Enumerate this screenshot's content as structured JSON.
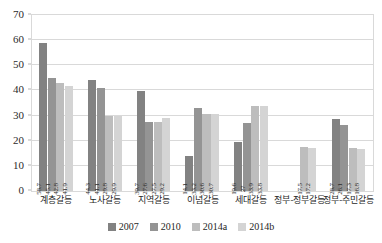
{
  "chart_data": {
    "type": "bar",
    "title": "",
    "xlabel": "",
    "ylabel": "",
    "ylim": [
      0,
      70
    ],
    "ytick_step": 10,
    "yticks": [
      0,
      10,
      20,
      30,
      40,
      50,
      60,
      70
    ],
    "grid": true,
    "legend_position": "bottom",
    "categories": [
      "계층갈등",
      "노사갈등",
      "지역갈등",
      "이념갈등",
      "세대갈등",
      "정부-정부갈등",
      "정부-주민갈등"
    ],
    "series": [
      {
        "name": "2007",
        "color": "#828282",
        "values": [
          58.7,
          44.3,
          39.7,
          14.1,
          19.6,
          null,
          28.7
        ]
      },
      {
        "name": "2010",
        "color": "#949494",
        "values": [
          45.1,
          41.1,
          27.6,
          33.2,
          27.0,
          null,
          26.1
        ]
      },
      {
        "name": "2014a",
        "color": "#bdbdbd",
        "values": [
          42.8,
          29.8,
          27.5,
          30.6,
          33.9,
          17.5,
          17.3
        ]
      },
      {
        "name": "2014b",
        "color": "#d4d4d4",
        "values": [
          41.9,
          29.9,
          29.2,
          30.7,
          33.8,
          17.2,
          16.8
        ]
      }
    ],
    "value_labels": [
      [
        "58.7",
        "45.1",
        "42.8",
        "41.9"
      ],
      [
        "44.3",
        "41.1",
        "29.8",
        "29.9"
      ],
      [
        "39.7",
        "27.6",
        "27.5",
        "29.2"
      ],
      [
        "14.1",
        "33.2",
        "30.6",
        "30.7"
      ],
      [
        "19.6",
        "27",
        "33.9",
        "33.8"
      ],
      [
        "",
        "",
        "17.5",
        "17.2"
      ],
      [
        "28.7",
        "26.1",
        "17.3",
        "16.8"
      ]
    ]
  },
  "style": {
    "grid_color": "#d9d9d9",
    "axis_text_color": "#2b2b2b",
    "plot_background": "#ffffff"
  }
}
